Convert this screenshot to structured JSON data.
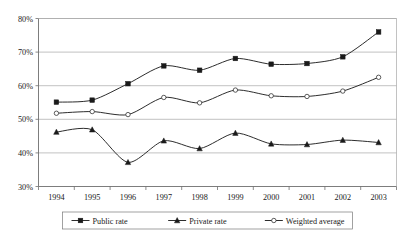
{
  "chart_data": {
    "type": "line",
    "title": "",
    "subtitle": "",
    "xlabel": "",
    "ylabel": "",
    "categories": [
      "1994",
      "1995",
      "1996",
      "1997",
      "1998",
      "1999",
      "2000",
      "2001",
      "2002",
      "2003"
    ],
    "x": [
      1994,
      1995,
      1996,
      1997,
      1998,
      1999,
      2000,
      2001,
      2002,
      2003
    ],
    "ylim": [
      30,
      80
    ],
    "ytick_values": [
      30,
      40,
      50,
      60,
      70,
      80
    ],
    "ytick_labels": [
      "30%",
      "40%",
      "50%",
      "60%",
      "70%",
      "80%"
    ],
    "grid": true,
    "grid_axis": "y",
    "legend_position": "bottom",
    "value_suffix": "%",
    "series": [
      {
        "name": "Public rate",
        "marker": "square-filled",
        "color": "#1a1a1a",
        "values": [
          55.1,
          55.7,
          60.6,
          65.9,
          64.6,
          68.1,
          66.4,
          66.6,
          68.6,
          76.0
        ]
      },
      {
        "name": "Private rate",
        "marker": "triangle-filled",
        "color": "#1a1a1a",
        "values": [
          46.2,
          46.9,
          37.2,
          43.6,
          41.3,
          45.9,
          42.7,
          42.5,
          43.8,
          43.1
        ]
      },
      {
        "name": "Weighted average",
        "marker": "circle-open",
        "color": "#333333",
        "values": [
          51.8,
          52.3,
          51.4,
          56.5,
          54.9,
          58.7,
          57.0,
          56.8,
          58.4,
          62.5
        ]
      }
    ]
  },
  "legend": {
    "items": [
      {
        "label": "Public rate"
      },
      {
        "label": "Private rate"
      },
      {
        "label": "Weighted average"
      }
    ]
  },
  "axes": {
    "y_labels": [
      "80%",
      "70%",
      "60%",
      "50%",
      "40%",
      "30%"
    ],
    "x_labels": [
      "1994",
      "1995",
      "1996",
      "1997",
      "1998",
      "1999",
      "2000",
      "2001",
      "2002",
      "2003"
    ]
  },
  "colors": {
    "ink": "#1a1a1a",
    "grid": "#a8a8a8",
    "axis": "#6e6e6e",
    "background": "#ffffff"
  }
}
